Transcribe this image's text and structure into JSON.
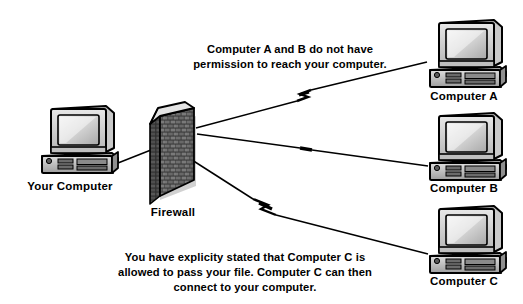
{
  "diagram": {
    "background_color": "#ffffff",
    "line_color": "#000000",
    "nodes": [
      {
        "id": "your-computer",
        "label": "Your Computer",
        "icon": "desktop-computer-icon",
        "x": 75,
        "y": 140
      },
      {
        "id": "firewall",
        "label": "Firewall",
        "icon": "brick-wall-icon",
        "x": 178,
        "y": 158
      },
      {
        "id": "computer-a",
        "label": "Computer A",
        "icon": "desktop-computer-icon",
        "x": 462,
        "y": 55
      },
      {
        "id": "computer-b",
        "label": "Computer B",
        "icon": "desktop-computer-icon",
        "x": 462,
        "y": 147
      },
      {
        "id": "computer-c",
        "label": "Computer C",
        "icon": "desktop-computer-icon",
        "x": 462,
        "y": 240
      }
    ],
    "connections": [
      {
        "id": "link-firewall-computer-a",
        "from": "firewall",
        "to": "computer-a",
        "broken": true
      },
      {
        "id": "link-firewall-computer-b",
        "from": "firewall",
        "to": "computer-b",
        "broken": true
      },
      {
        "id": "link-firewall-computer-c",
        "from": "firewall",
        "to": "computer-c",
        "broken": true
      },
      {
        "id": "link-your-computer-firewall",
        "from": "your-computer",
        "to": "firewall",
        "broken": false
      }
    ],
    "captions": {
      "top": {
        "id": "caption-deny",
        "lines": [
          "Computer A and B do not have",
          "permission to reach your computer."
        ]
      },
      "bottom": {
        "id": "caption-allow",
        "lines": [
          "You have explicity stated that Computer C is",
          "allowed to pass your file.  Computer C can then",
          "connect to your computer."
        ]
      }
    }
  }
}
